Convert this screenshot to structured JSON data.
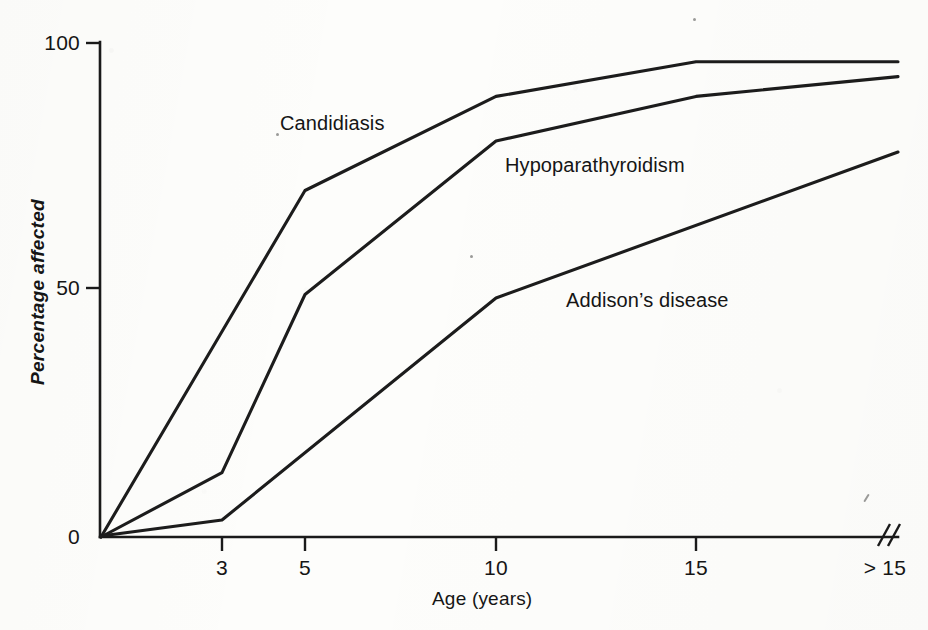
{
  "chart_data": {
    "type": "line",
    "title": "",
    "xlabel": "Age (years)",
    "ylabel": "Percentage affected",
    "x_tick_labels": [
      "3",
      "5",
      "10",
      "15",
      "> 15"
    ],
    "x_tick_values": [
      3,
      5,
      10,
      15,
      16
    ],
    "y_tick_labels": [
      "0",
      "50",
      "100"
    ],
    "y_tick_values": [
      0,
      50,
      100
    ],
    "ylim": [
      0,
      100
    ],
    "xlim": [
      0,
      16
    ],
    "grid": false,
    "legend": "inline-annotations",
    "axis_break": true,
    "axis_break_label": "> 15",
    "series": [
      {
        "name": "Candidiasis",
        "label": "Candidiasis",
        "x": [
          0,
          5,
          10,
          15,
          16
        ],
        "values": [
          0,
          70,
          89,
          96,
          96
        ]
      },
      {
        "name": "Hypoparathyroidism",
        "label": "Hypoparathyroidism",
        "x": [
          0,
          3,
          5,
          10,
          15,
          16
        ],
        "values": [
          0,
          13,
          49,
          80,
          89,
          93
        ]
      },
      {
        "name": "Addison's disease",
        "label": "Addison’s disease",
        "x": [
          0,
          3,
          10,
          16
        ],
        "values": [
          0,
          3.5,
          48,
          77
        ]
      }
    ],
    "annotations": [
      {
        "text": "Candidiasis",
        "x_px": 280,
        "y_px": 123
      },
      {
        "text": "Hypoparathyroidism",
        "x_px": 505,
        "y_px": 165
      },
      {
        "text": "Addison’s disease",
        "x_px": 566,
        "y_px": 300
      }
    ]
  },
  "colors": {
    "background": "#fdfdfb",
    "ink": "#1a1a1a",
    "line": "#1c1c1c"
  },
  "geometry": {
    "origin_x": 100,
    "origin_y": 537,
    "top_y": 42,
    "y50_y": 288,
    "right_x": 898,
    "x_tick_px": [
      222,
      305,
      496,
      696,
      898
    ]
  }
}
